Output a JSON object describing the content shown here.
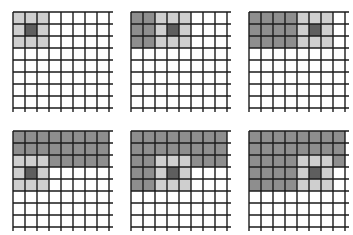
{
  "diagram": {
    "grid": {
      "rows": 8,
      "cols": 8,
      "cell_px": 12
    },
    "colors": {
      "empty": "#ffffff",
      "processed": "#8e8e8e",
      "kernel": "#cfcfcf",
      "kernel_center": "#5e5e5e",
      "line": "#1a1a1a"
    },
    "panels": [
      {
        "id": "step-1",
        "x": 13,
        "y": 12,
        "kernel_center": [
          1,
          1
        ],
        "processed": []
      },
      {
        "id": "step-2",
        "x": 131,
        "y": 12,
        "kernel_center": [
          1,
          3
        ],
        "processed": [
          [
            0,
            0
          ],
          [
            0,
            1
          ],
          [
            1,
            0
          ],
          [
            1,
            1
          ],
          [
            2,
            0
          ],
          [
            2,
            1
          ]
        ]
      },
      {
        "id": "step-3",
        "x": 249,
        "y": 12,
        "kernel_center": [
          1,
          5
        ],
        "processed": [
          [
            0,
            0
          ],
          [
            0,
            1
          ],
          [
            0,
            2
          ],
          [
            0,
            3
          ],
          [
            1,
            0
          ],
          [
            1,
            1
          ],
          [
            1,
            2
          ],
          [
            1,
            3
          ],
          [
            2,
            0
          ],
          [
            2,
            1
          ],
          [
            2,
            2
          ],
          [
            2,
            3
          ]
        ]
      },
      {
        "id": "step-4",
        "x": 13,
        "y": 131,
        "kernel_center": [
          3,
          1
        ],
        "processed": [
          [
            0,
            0
          ],
          [
            0,
            1
          ],
          [
            0,
            2
          ],
          [
            0,
            3
          ],
          [
            0,
            4
          ],
          [
            0,
            5
          ],
          [
            0,
            6
          ],
          [
            0,
            7
          ],
          [
            1,
            0
          ],
          [
            1,
            1
          ],
          [
            1,
            2
          ],
          [
            1,
            3
          ],
          [
            1,
            4
          ],
          [
            1,
            5
          ],
          [
            1,
            6
          ],
          [
            1,
            7
          ],
          [
            2,
            3
          ],
          [
            2,
            4
          ],
          [
            2,
            5
          ],
          [
            2,
            6
          ],
          [
            2,
            7
          ]
        ]
      },
      {
        "id": "step-5",
        "x": 131,
        "y": 131,
        "kernel_center": [
          3,
          3
        ],
        "processed": [
          [
            0,
            0
          ],
          [
            0,
            1
          ],
          [
            0,
            2
          ],
          [
            0,
            3
          ],
          [
            0,
            4
          ],
          [
            0,
            5
          ],
          [
            0,
            6
          ],
          [
            0,
            7
          ],
          [
            1,
            0
          ],
          [
            1,
            1
          ],
          [
            1,
            2
          ],
          [
            1,
            3
          ],
          [
            1,
            4
          ],
          [
            1,
            5
          ],
          [
            1,
            6
          ],
          [
            1,
            7
          ],
          [
            2,
            0
          ],
          [
            2,
            1
          ],
          [
            2,
            5
          ],
          [
            2,
            6
          ],
          [
            2,
            7
          ],
          [
            3,
            0
          ],
          [
            3,
            1
          ],
          [
            4,
            0
          ],
          [
            4,
            1
          ]
        ]
      },
      {
        "id": "step-6",
        "x": 249,
        "y": 131,
        "kernel_center": [
          3,
          5
        ],
        "processed": [
          [
            0,
            0
          ],
          [
            0,
            1
          ],
          [
            0,
            2
          ],
          [
            0,
            3
          ],
          [
            0,
            4
          ],
          [
            0,
            5
          ],
          [
            0,
            6
          ],
          [
            0,
            7
          ],
          [
            1,
            0
          ],
          [
            1,
            1
          ],
          [
            1,
            2
          ],
          [
            1,
            3
          ],
          [
            1,
            4
          ],
          [
            1,
            5
          ],
          [
            1,
            6
          ],
          [
            1,
            7
          ],
          [
            2,
            0
          ],
          [
            2,
            1
          ],
          [
            2,
            2
          ],
          [
            2,
            3
          ],
          [
            2,
            7
          ],
          [
            3,
            0
          ],
          [
            3,
            1
          ],
          [
            3,
            2
          ],
          [
            3,
            3
          ],
          [
            4,
            0
          ],
          [
            4,
            1
          ],
          [
            4,
            2
          ],
          [
            4,
            3
          ]
        ]
      }
    ]
  }
}
